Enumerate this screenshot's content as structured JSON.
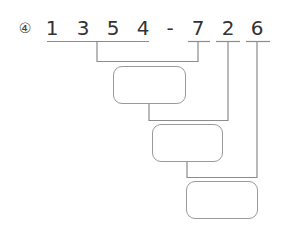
{
  "problem": {
    "number_label": "④",
    "digits": [
      {
        "char": "1",
        "x": 52
      },
      {
        "char": "3",
        "x": 83
      },
      {
        "char": "5",
        "x": 113
      },
      {
        "char": "4",
        "x": 143
      },
      {
        "char": "-",
        "x": 170
      },
      {
        "char": "7",
        "x": 198
      },
      {
        "char": "2",
        "x": 228
      },
      {
        "char": "6",
        "x": 257
      }
    ],
    "expression": "1354-726"
  },
  "answer_boxes": [
    {
      "id": "box-1",
      "value": ""
    },
    {
      "id": "box-2",
      "value": ""
    },
    {
      "id": "box-3",
      "value": ""
    }
  ],
  "colors": {
    "text": "#333333",
    "line": "#8c8c8c",
    "box_border": "#9a9a9a"
  }
}
